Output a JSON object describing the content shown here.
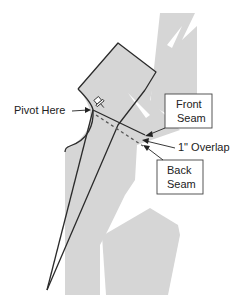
{
  "diagram": {
    "type": "sewing-pattern-pivot",
    "labels": {
      "pivot": "Pivot Here",
      "front_seam_line1": "Front",
      "front_seam_line2": "Seam",
      "overlap": "1\" Overlap",
      "back_seam_line1": "Back",
      "back_seam_line2": "Seam"
    },
    "icons": {
      "pin": "push-pin-icon"
    },
    "colors": {
      "pattern_fill": "#d6d6d6",
      "outline": "#2b2b2b",
      "background": "#ffffff"
    }
  }
}
